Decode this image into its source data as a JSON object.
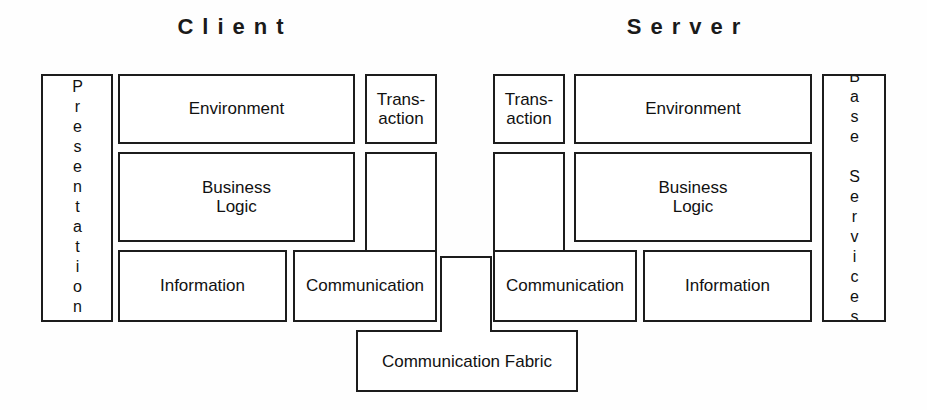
{
  "figure": {
    "titles": {
      "client": "Client",
      "server": "Server"
    },
    "client": {
      "presentation": "Presentation",
      "environment": "Environment",
      "transaction": "Trans-\naction",
      "business_logic": "Business\nLogic",
      "information": "Information",
      "communication": "Communication"
    },
    "server": {
      "transaction": "Trans-\naction",
      "environment": "Environment",
      "business_logic": "Business\nLogic",
      "communication": "Communication",
      "information": "Information",
      "base_services": "Base Services"
    },
    "fabric": {
      "label": "Communication Fabric"
    },
    "colors": {
      "stroke": "#1c1c1c",
      "fill": "#ffffff",
      "text": "#111111",
      "background": "#fefefe"
    }
  }
}
